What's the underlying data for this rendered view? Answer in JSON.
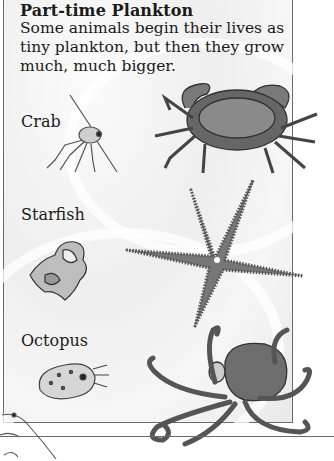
{
  "heading": "Part-time Plankton",
  "intro": "Some animals begin their lives as tiny plankton, but then they grow much, much bigger.",
  "sections": [
    {
      "label": "Crab",
      "larva_icon": "crab-larva-icon",
      "adult_icon": "crab-adult-icon"
    },
    {
      "label": "Starfish",
      "larva_icon": "starfish-larva-icon",
      "adult_icon": "starfish-adult-icon"
    },
    {
      "label": "Octopus",
      "larva_icon": "octopus-larva-icon",
      "adult_icon": "octopus-adult-icon"
    }
  ],
  "colors": {
    "border": "#6a6a6a",
    "text": "#1a1a1a",
    "panel_bg": "#f0f0f0"
  }
}
